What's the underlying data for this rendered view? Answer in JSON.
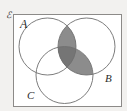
{
  "figure": {
    "kind": "venn-diagram",
    "set_count": 3,
    "background_color": "#f2f1ef",
    "universe_fill": "#ffffff",
    "stroke_color": "#6e6e6e",
    "label_color": "#2b2b2b"
  },
  "universe": {
    "label": "ℰ",
    "name": "universal-set",
    "border_color": "#8c8a88",
    "fill": "#ffffff",
    "x": 13,
    "y": 14,
    "width": 108,
    "height": 92
  },
  "circles": [
    {
      "id": "A",
      "label": "A",
      "cx": 47.5,
      "cy": 46.5,
      "r": 28.5,
      "stroke": "#6e6e6e",
      "label_x": 20,
      "label_y": 28
    },
    {
      "id": "B",
      "label": "B",
      "cx": 86.5,
      "cy": 46.5,
      "r": 28.5,
      "stroke": "#6e6e6e",
      "label_x": 105,
      "label_y": 82
    },
    {
      "id": "C",
      "label": "C",
      "cx": 64.5,
      "cy": 75.0,
      "r": 28.5,
      "stroke": "#6e6e6e",
      "label_x": 27,
      "label_y": 99
    }
  ],
  "shaded_regions": [
    {
      "id": "A-and-B",
      "description": "A ∩ B",
      "fill": "#8c8c8c",
      "opacity": 1
    },
    {
      "id": "B-and-C",
      "description": "B ∩ C",
      "fill": "#8c8c8c",
      "opacity": 1
    },
    {
      "id": "A-and-B-and-C",
      "description": "A ∩ B ∩ C",
      "fill": "#757575",
      "opacity": 1
    }
  ],
  "shaded_expression": "(A ∩ B) ∪ (B ∩ C)"
}
